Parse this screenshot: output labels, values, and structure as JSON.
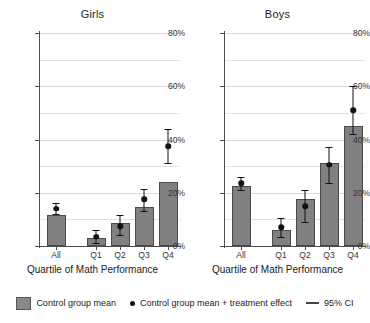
{
  "chart_data": {
    "type": "bar",
    "title": "",
    "xlabel": "Quartile of Math Performance",
    "ylabel": "",
    "ylim": [
      0,
      80
    ],
    "yticks": [
      0,
      20,
      40,
      60,
      80
    ],
    "ytick_labels": [
      "0%",
      "20%",
      "40%",
      "60%",
      "80%"
    ],
    "gridlines": [
      10,
      20,
      30,
      40,
      50,
      60,
      70,
      80
    ],
    "grid": true,
    "legend_position": "bottom",
    "categories": [
      "All",
      "Q1",
      "Q2",
      "Q3",
      "Q4"
    ],
    "panels": [
      {
        "title": "Girls",
        "xlabel": "Quartile of Math Performance",
        "categories": [
          "All",
          "Q1",
          "Q2",
          "Q3",
          "Q4"
        ],
        "series": [
          {
            "name": "Control group mean",
            "values": [
              11.5,
              3.0,
              8.5,
              14.5,
              24.0
            ]
          },
          {
            "name": "Control group mean + treatment effect",
            "values": [
              14.0,
              3.5,
              7.5,
              17.5,
              37.5
            ],
            "ci_low": [
              12.0,
              1.0,
              4.0,
              13.0,
              31.0
            ],
            "ci_high": [
              16.0,
              6.0,
              11.5,
              21.5,
              44.0
            ]
          }
        ]
      },
      {
        "title": "Boys",
        "xlabel": "Quartile of Math Performance",
        "categories": [
          "All",
          "Q1",
          "Q2",
          "Q3",
          "Q4"
        ],
        "series": [
          {
            "name": "Control group mean",
            "values": [
              22.5,
              6.0,
              17.5,
              31.0,
              45.0
            ]
          },
          {
            "name": "Control group mean + treatment effect",
            "values": [
              23.5,
              7.0,
              15.0,
              30.5,
              51.0
            ],
            "ci_low": [
              21.0,
              3.5,
              9.0,
              23.5,
              42.0
            ],
            "ci_high": [
              26.0,
              10.5,
              21.0,
              37.0,
              60.0
            ]
          }
        ]
      }
    ],
    "legend": [
      {
        "label": "Control group mean",
        "marker": "square",
        "color": "#8a8a8a"
      },
      {
        "label": "Control group mean + treatment effect",
        "marker": "dot",
        "color": "#111111"
      },
      {
        "label": "95% CI",
        "marker": "line",
        "color": "#444444"
      }
    ]
  }
}
